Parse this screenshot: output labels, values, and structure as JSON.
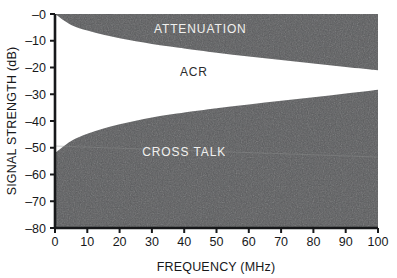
{
  "chart_data": {
    "type": "area",
    "title": "",
    "xlabel": "FREQUENCY (MHz)",
    "ylabel": "SIGNAL STRENGTH (dB)",
    "xlim": [
      0,
      100
    ],
    "ylim": [
      -80,
      0
    ],
    "grid": false,
    "legend": "none",
    "x_ticks": [
      "0",
      "10",
      "20",
      "30",
      "40",
      "50",
      "60",
      "70",
      "80",
      "90",
      "100"
    ],
    "x_tick_values": [
      0,
      10,
      20,
      30,
      40,
      50,
      60,
      70,
      80,
      90,
      100
    ],
    "y_ticks": [
      "–0",
      "–10",
      "–20",
      "–30",
      "–40",
      "–50",
      "–60",
      "–70",
      "–80"
    ],
    "y_tick_values": [
      0,
      -10,
      -20,
      -30,
      -40,
      -50,
      -60,
      -70,
      -80
    ],
    "series": [
      {
        "name": "ATTENUATION",
        "description": "Upper boundary curve; region above it is shaded (attenuation).",
        "x": [
          0,
          5,
          10,
          15,
          20,
          25,
          30,
          35,
          40,
          50,
          60,
          70,
          80,
          90,
          100
        ],
        "values": [
          0,
          -4.1,
          -6.2,
          -7.8,
          -9.1,
          -10.2,
          -11.2,
          -12.1,
          -12.9,
          -14.5,
          -15.9,
          -17.2,
          -18.5,
          -19.8,
          -21.0
        ]
      },
      {
        "name": "CROSS TALK",
        "description": "Lower boundary curve; region below it is shaded (cross talk).",
        "x": [
          0,
          5,
          10,
          15,
          20,
          25,
          30,
          35,
          40,
          50,
          60,
          70,
          80,
          90,
          100
        ],
        "values": [
          -52.0,
          -47.5,
          -44.8,
          -42.8,
          -41.2,
          -39.9,
          -38.7,
          -37.7,
          -36.8,
          -35.2,
          -33.8,
          -32.4,
          -31.1,
          -29.7,
          -28.3
        ]
      }
    ],
    "region_labels": [
      {
        "text": "ATTENUATION",
        "x": 45,
        "y": -7,
        "tone": "light"
      },
      {
        "text": "ACR",
        "x": 43,
        "y": -23,
        "tone": "dark"
      },
      {
        "text": "CROSS TALK",
        "x": 40,
        "y": -53,
        "tone": "light"
      }
    ],
    "colors": {
      "shaded_region": "#5a5b5d",
      "open_band": "#ffffff",
      "axis": "#17181a",
      "label_light": "#f1f1ef",
      "label_dark": "#2a2b2d"
    }
  }
}
